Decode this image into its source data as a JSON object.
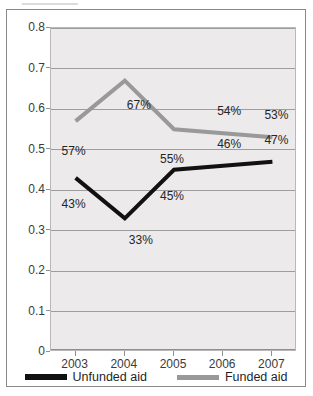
{
  "chart_data": {
    "type": "line",
    "title": "",
    "xlabel": "",
    "ylabel": "Contribution to total financial aid (%)",
    "categories": [
      "2003",
      "2004",
      "2005",
      "2006",
      "2007"
    ],
    "ylim": [
      0,
      0.8
    ],
    "ytick_labels": [
      "0",
      "0.1",
      "0.2",
      "0.3",
      "0.4",
      "0.5",
      "0.6",
      "0.7",
      "0.8"
    ],
    "ytick_values": [
      0,
      0.1,
      0.2,
      0.3,
      0.4,
      0.5,
      0.6,
      0.7,
      0.8
    ],
    "grid": true,
    "legend_position": "bottom",
    "series": [
      {
        "name": "Unfunded aid",
        "color": "#111111",
        "values": [
          0.43,
          0.33,
          0.45,
          0.46,
          0.47
        ],
        "labels": [
          "43%",
          "33%",
          "45%",
          "46%",
          "47%"
        ]
      },
      {
        "name": "Funded aid",
        "color": "#999999",
        "values": [
          0.57,
          0.67,
          0.55,
          0.54,
          0.53
        ],
        "labels": [
          "57%",
          "67%",
          "55%",
          "54%",
          "53%"
        ]
      }
    ]
  },
  "legend": {
    "items": [
      {
        "label": "Unfunded aid",
        "color": "#111111"
      },
      {
        "label": "Funded aid",
        "color": "#999999"
      }
    ]
  }
}
